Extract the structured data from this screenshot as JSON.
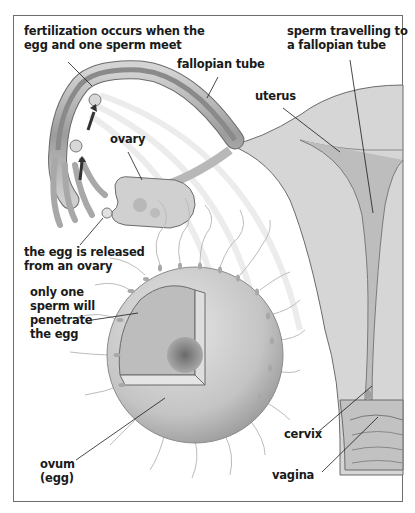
{
  "diagram": {
    "labels": {
      "fertilization": "fertilization occurs when the\negg and one sperm meet",
      "fallopian_tube": "fallopian tube",
      "sperm_travelling": "sperm travelling to\na fallopian tube",
      "uterus": "uterus",
      "ovary": "ovary",
      "egg_released": "the egg is released\nfrom an ovary",
      "one_sperm": "only one\nsperm will\npenetrate\nthe egg",
      "ovum": "ovum\n(egg)",
      "cervix": "cervix",
      "vagina": "vagina"
    },
    "colors": {
      "tissue": "#c9c9c9",
      "tissue_dark": "#8f8f8f",
      "tissue_light": "#e4e4e4",
      "outline": "#6b6b6b",
      "leader_line": "#1a1a1a",
      "text": "#1a1a1a"
    }
  }
}
